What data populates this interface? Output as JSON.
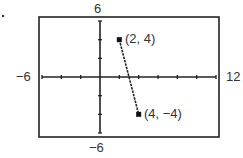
{
  "chart_data": {
    "type": "line",
    "title": "",
    "xlabel": "",
    "ylabel": "",
    "xlim": [
      -6,
      12
    ],
    "ylim": [
      -6,
      6
    ],
    "x_tick_step": 2,
    "y_tick_step": 2,
    "grid": false,
    "window_labels": {
      "xmin": "−6",
      "xmax": "12",
      "ymin": "−6",
      "ymax": "6"
    },
    "series": [
      {
        "name": "segment",
        "points": [
          {
            "x": 2,
            "y": 4,
            "label": "(2, 4)"
          },
          {
            "x": 4,
            "y": -4,
            "label": "(4, −4)"
          }
        ]
      }
    ]
  }
}
